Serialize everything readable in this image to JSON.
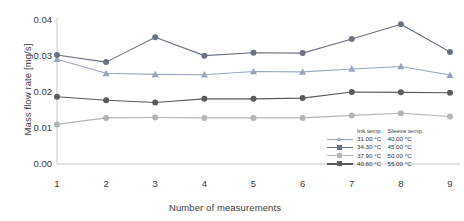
{
  "chart_data": {
    "type": "line",
    "title": "",
    "xlabel": "Number of measurements",
    "ylabel": "Mass flow rate [mg/s]",
    "x": [
      1,
      2,
      3,
      4,
      5,
      6,
      7,
      8,
      9
    ],
    "xticklabels": [
      "1",
      "2",
      "3",
      "4",
      "5",
      "6",
      "7",
      "8",
      "9"
    ],
    "yticklabels": [
      "0.00",
      "0.01",
      "0.02",
      "0.03",
      "0.04"
    ],
    "ytickvalues": [
      0.0,
      0.01,
      0.02,
      0.03,
      0.04
    ],
    "ylim": [
      0.0,
      0.04
    ],
    "xlim": [
      1,
      9
    ],
    "grid": false,
    "legend_position": "inside-bottom-right",
    "legend_headers": [
      "Ink temp.",
      "Sleeve temp."
    ],
    "series": [
      {
        "name": "31.00 °C / 40.00 °C",
        "ink_temp": "31.00 °C",
        "sleeve_temp": "40.00 °C",
        "color": "#9aa7bb",
        "marker": "triangle",
        "values": [
          0.0291,
          0.0252,
          0.0249,
          0.0248,
          0.0257,
          0.0256,
          0.0264,
          0.0271,
          0.0247
        ]
      },
      {
        "name": "34.30 °C / 45.00 °C",
        "ink_temp": "34.30 °C",
        "sleeve_temp": "45.00 °C",
        "color": "#6b7280",
        "marker": "circle",
        "values": [
          0.0303,
          0.0283,
          0.0352,
          0.0301,
          0.0309,
          0.0308,
          0.0347,
          0.0388,
          0.0311
        ]
      },
      {
        "name": "37.90 °C / 50.00 °C",
        "ink_temp": "37.90 °C",
        "sleeve_temp": "50.00 °C",
        "color": "#b5b5b5",
        "marker": "circle",
        "values": [
          0.011,
          0.0128,
          0.0129,
          0.0128,
          0.0128,
          0.0128,
          0.0135,
          0.0141,
          0.0132
        ]
      },
      {
        "name": "40.60 °C / 55.00 °C",
        "ink_temp": "40.60 °C",
        "sleeve_temp": "55.00 °C",
        "color": "#5b5b5b",
        "marker": "circle",
        "values": [
          0.0187,
          0.0177,
          0.0171,
          0.0181,
          0.0181,
          0.0183,
          0.02,
          0.0199,
          0.0198
        ]
      }
    ]
  }
}
